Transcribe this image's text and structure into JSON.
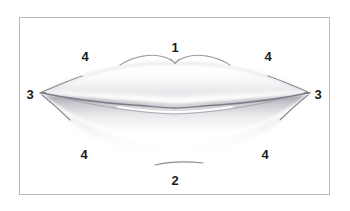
{
  "figure": {
    "background_color": "#ffffff",
    "frame": {
      "border_color": "#b9b9b9",
      "x": 19,
      "y": 17,
      "width": 311,
      "height": 178
    },
    "drawing": {
      "medium": "graphite pencil sketch",
      "subject": "pair of human lips, frontal view",
      "line_color": "#8a8a94",
      "shading_color": "#9a9aa4",
      "highlight_color": "#ffffff"
    }
  },
  "labels": [
    {
      "id": "label-1",
      "text": "1",
      "x": 175,
      "y": 48,
      "refers_to": "cupid's bow / top edge of upper lip"
    },
    {
      "id": "label-2",
      "text": "2",
      "x": 175,
      "y": 181,
      "refers_to": "crease line below lower lip"
    },
    {
      "id": "label-3-left",
      "text": "3",
      "x": 30,
      "y": 95,
      "refers_to": "left mouth corner"
    },
    {
      "id": "label-3-right",
      "text": "3",
      "x": 318,
      "y": 95,
      "refers_to": "right mouth corner"
    },
    {
      "id": "label-4-top-left",
      "text": "4",
      "x": 85,
      "y": 57,
      "refers_to": "upper left lip area"
    },
    {
      "id": "label-4-top-right",
      "text": "4",
      "x": 268,
      "y": 57,
      "refers_to": "upper right lip area"
    },
    {
      "id": "label-4-bottom-left",
      "text": "4",
      "x": 84,
      "y": 155,
      "refers_to": "lower left lip area"
    },
    {
      "id": "label-4-bottom-right",
      "text": "4",
      "x": 265,
      "y": 155,
      "refers_to": "lower right lip area"
    }
  ]
}
